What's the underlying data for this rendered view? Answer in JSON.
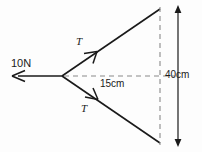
{
  "diagram": {
    "background_color": "#fdfdfd",
    "stroke_color": "#1a1a1a",
    "dashed_color": "#8a8a8a",
    "labels": {
      "applied_force": "10N",
      "tension_upper": "T",
      "tension_lower": "T",
      "horizontal_dimension": "15cm",
      "vertical_dimension": "40cm"
    },
    "geometry": {
      "vertex_x": 62,
      "vertex_y": 76,
      "force_arrow_tip_x": 12,
      "force_arrow_tip_y": 76,
      "upper_arm_end_x": 160,
      "upper_arm_end_y": 9,
      "lower_arm_end_x": 160,
      "lower_arm_end_y": 143,
      "midline_end_x": 160,
      "dim_line_x": 178,
      "dim_line_top_y": 7,
      "dim_line_bottom_y": 145
    },
    "values": {
      "applied_force_magnitude": 10,
      "applied_force_unit": "N",
      "half_span": 20,
      "span": 40,
      "span_unit": "cm",
      "horizontal_length": 15,
      "horizontal_unit": "cm"
    }
  }
}
